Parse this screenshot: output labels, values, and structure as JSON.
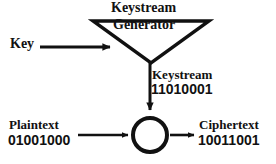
{
  "diagram": {
    "background_color": "#ffffff",
    "stroke_color": "#111111",
    "text_color": "#111111",
    "labels": {
      "keystream_title": "Keystream",
      "generator": "Generator",
      "key": "Key",
      "keystream_name": "Keystream",
      "keystream_bits": "11010001",
      "plaintext_name": "Plaintext",
      "plaintext_bits": "01001000",
      "ciphertext_name": "Ciphertext",
      "ciphertext_bits": "10011001"
    },
    "shapes": {
      "generator_triangle": "inverted-triangle",
      "combiner": "circle"
    },
    "arrows": [
      {
        "name": "key-to-generator",
        "direction": "right"
      },
      {
        "name": "generator-to-combiner",
        "direction": "down"
      },
      {
        "name": "plaintext-to-combiner",
        "direction": "right"
      },
      {
        "name": "combiner-to-ciphertext",
        "direction": "right"
      }
    ]
  }
}
